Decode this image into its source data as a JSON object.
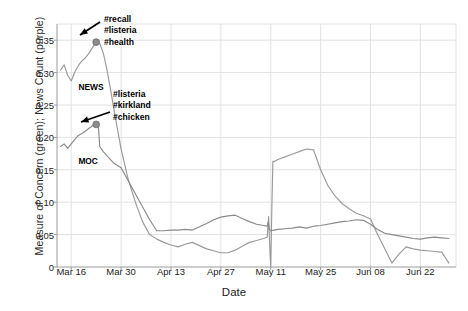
{
  "chart_data": {
    "type": "line",
    "title": "",
    "xlabel": "Date",
    "ylabel": "Measure of Concern (green); News Count (purple)",
    "ylim": [
      0,
      0.375
    ],
    "yticks": [
      "0",
      "0.05",
      "0.10",
      "0.15",
      "0.20",
      "0.25",
      "0.30",
      "0.35"
    ],
    "ytick_values": [
      0,
      0.05,
      0.1,
      0.15,
      0.2,
      0.25,
      0.3,
      0.35
    ],
    "xticks": [
      "Mar 16",
      "Mar 30",
      "Apr 13",
      "Apr 27",
      "May 11",
      "May 25",
      "Jun 08",
      "Jun 22"
    ],
    "xtick_days": [
      0,
      14,
      28,
      42,
      56,
      70,
      84,
      98
    ],
    "xlim_days": [
      -4,
      108
    ],
    "grid": true,
    "legend_position": "inline-annotations",
    "colors": {
      "news": "#9a9a9a",
      "moc": "#8a8a8a",
      "grid": "#e2e2e2",
      "axis": "#9b9b9b",
      "marker": "#8c8c8c",
      "arrow": "#000000",
      "text": "#1c1c1c"
    },
    "series": [
      {
        "name": "News Count (purple)",
        "label": "NEWS",
        "label_at": {
          "x_day": 2.0,
          "y": 0.278
        },
        "x": [
          -3,
          -2,
          -1,
          0,
          1,
          2,
          3,
          4,
          5,
          6,
          7,
          8,
          9,
          10,
          11,
          12,
          13,
          14,
          16,
          18,
          20,
          22,
          24,
          26,
          28,
          30,
          32,
          34,
          36,
          38,
          40,
          42,
          44,
          46,
          48,
          50,
          52,
          54,
          55,
          55.4,
          55.8,
          56,
          56.3,
          56.6,
          57,
          58,
          60,
          62,
          64,
          66,
          68,
          70,
          72,
          74,
          76,
          78,
          80,
          82,
          84,
          86,
          88,
          90,
          92,
          94,
          96,
          98,
          100,
          102,
          104,
          106
        ],
        "y": [
          0.304,
          0.312,
          0.296,
          0.287,
          0.301,
          0.311,
          0.318,
          0.323,
          0.33,
          0.339,
          0.347,
          0.345,
          0.33,
          0.305,
          0.275,
          0.243,
          0.212,
          0.182,
          0.135,
          0.1,
          0.07,
          0.05,
          0.043,
          0.038,
          0.034,
          0.031,
          0.035,
          0.038,
          0.033,
          0.028,
          0.025,
          0.022,
          0.022,
          0.026,
          0.032,
          0.038,
          0.041,
          0.044,
          0.046,
          0.078,
          0.02,
          0.0,
          0.09,
          0.163,
          0.163,
          0.166,
          0.17,
          0.174,
          0.178,
          0.182,
          0.181,
          0.15,
          0.126,
          0.11,
          0.098,
          0.09,
          0.083,
          0.079,
          0.074,
          0.05,
          0.028,
          0.006,
          0.02,
          0.031,
          0.028,
          0.026,
          0.025,
          0.024,
          0.023,
          0.006
        ],
        "markers": [
          {
            "x_day": 7,
            "y": 0.347,
            "annotation": [
              "#recall",
              "#listeria",
              "#health"
            ]
          }
        ]
      },
      {
        "name": "Measure of Concern (green)",
        "label": "MOC",
        "label_at": {
          "x_day": 2.0,
          "y": 0.163
        },
        "x": [
          -3,
          -2,
          -1,
          0,
          1,
          2,
          3,
          4,
          5,
          6,
          7,
          7.6,
          8,
          9,
          10,
          12,
          14,
          16,
          18,
          20,
          22,
          24,
          26,
          28,
          30,
          32,
          34,
          36,
          38,
          40,
          42,
          44,
          46,
          48,
          50,
          52,
          54,
          55,
          55.3,
          55.6,
          56,
          57,
          58,
          60,
          62,
          64,
          66,
          68,
          70,
          72,
          74,
          76,
          78,
          80,
          82,
          84,
          86,
          88,
          90,
          92,
          94,
          96,
          98,
          100,
          102,
          104,
          106
        ],
        "y": [
          0.186,
          0.19,
          0.183,
          0.19,
          0.197,
          0.203,
          0.206,
          0.21,
          0.214,
          0.218,
          0.22,
          0.219,
          0.186,
          0.178,
          0.172,
          0.16,
          0.153,
          0.133,
          0.113,
          0.093,
          0.073,
          0.056,
          0.056,
          0.057,
          0.057,
          0.058,
          0.057,
          0.062,
          0.067,
          0.073,
          0.077,
          0.079,
          0.08,
          0.075,
          0.07,
          0.066,
          0.064,
          0.063,
          0.07,
          0.058,
          0.056,
          0.057,
          0.058,
          0.059,
          0.06,
          0.062,
          0.06,
          0.063,
          0.064,
          0.066,
          0.068,
          0.07,
          0.071,
          0.073,
          0.072,
          0.066,
          0.058,
          0.052,
          0.05,
          0.048,
          0.046,
          0.044,
          0.043,
          0.045,
          0.046,
          0.045,
          0.044
        ],
        "markers": [
          {
            "x_day": 7,
            "y": 0.22,
            "annotation": [
              "#listeria",
              "#kirkland",
              "#chicken"
            ]
          }
        ]
      }
    ],
    "annotations": [
      {
        "id": "annot-news-peak",
        "lines": [
          "#recall",
          "#listeria",
          "#health"
        ],
        "text_x": 104,
        "text_y": 14,
        "arrow_from_x": 100,
        "arrow_from_y": 22,
        "arrow_to_x": 80,
        "arrow_to_y": 35
      },
      {
        "id": "annot-moc-peak",
        "lines": [
          "#listeria",
          "#kirkland",
          "#chicken"
        ],
        "text_x": 113,
        "text_y": 89,
        "arrow_from_x": 110,
        "arrow_from_y": 112,
        "arrow_to_x": 81,
        "arrow_to_y": 122
      }
    ]
  }
}
